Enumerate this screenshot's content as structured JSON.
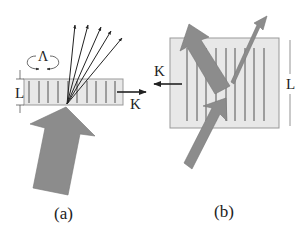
{
  "panels": {
    "a": {
      "caption": "(a)",
      "labels": {
        "lambda": "Λ",
        "thickness": "L",
        "grating_vector": "K"
      }
    },
    "b": {
      "caption": "(b)",
      "labels": {
        "thickness": "L",
        "grating_vector": "K"
      }
    }
  },
  "colors": {
    "slab_fill": "#e8e8e8",
    "slab_stroke": "#999999",
    "fringe": "#444444",
    "big_arrow": "#8c8c8c",
    "ray": "#222222"
  }
}
